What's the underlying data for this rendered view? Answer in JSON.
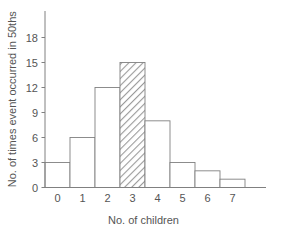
{
  "chart_data": {
    "type": "bar",
    "title": "",
    "subtitle": "",
    "xlabel": "No. of children",
    "ylabel": "No. of times event occurred in 50ths",
    "categories": [
      "0",
      "1",
      "2",
      "3",
      "4",
      "5",
      "6",
      "7"
    ],
    "values": [
      3,
      6,
      12,
      15,
      8,
      3,
      2,
      1
    ],
    "highlighted_category": "3",
    "highlight_style": "diagonal-hatch",
    "xlim": [
      -0.5,
      8.2
    ],
    "ylim": [
      0,
      19.5
    ],
    "yticks": [
      0,
      3,
      6,
      9,
      12,
      15,
      18
    ],
    "ytick_labels": [
      "0",
      "3",
      "6",
      "9",
      "12",
      "15",
      "18"
    ],
    "xtick_labels": [
      "0",
      "1",
      "2",
      "3",
      "4",
      "5",
      "6",
      "7"
    ],
    "grid": false,
    "legend": "none",
    "bar_fill": "#ffffff",
    "bar_edge": "#808080",
    "axis_color": "#808080",
    "text_color": "#555555",
    "annotations": []
  },
  "figure": {
    "background": "#ffffff",
    "width": 284,
    "height": 230
  }
}
